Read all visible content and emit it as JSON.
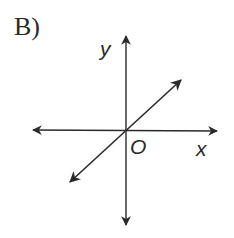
{
  "figure": {
    "option_label": "B)",
    "axes": {
      "x_label": "x",
      "y_label": "y",
      "origin_label": "O"
    },
    "line": {
      "description": "straight line through the origin with positive slope",
      "passes_through_origin": true,
      "slope_sign": "positive"
    },
    "colors": {
      "stroke": "#2a2a2a",
      "background": "#ffffff"
    }
  }
}
